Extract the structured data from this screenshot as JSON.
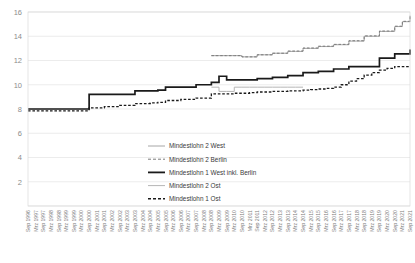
{
  "chart_data": {
    "type": "line",
    "title": "",
    "xlabel": "",
    "ylabel": "",
    "ylim": [
      0,
      16
    ],
    "ytick_step": 2,
    "yticks": [
      0,
      2,
      4,
      6,
      8,
      10,
      12,
      14,
      16
    ],
    "ytick_labels": [
      "0",
      "2",
      "4",
      "6",
      "8",
      "10",
      "12",
      "14",
      "16"
    ],
    "grid": true,
    "grid_axis": "y",
    "legend_position": "inside-bottom-center",
    "x": [
      "Sep 1996",
      "Mrz 1997",
      "Sep 1997",
      "Mrz 1998",
      "Sep 1998",
      "Mrz 1999",
      "Sep 1999",
      "Mrz 2000",
      "Sep 2000",
      "Mrz 2001",
      "Sep 2001",
      "Mrz 2002",
      "Sep 2002",
      "Mrz 2003",
      "Sep 2003",
      "Mrz 2004",
      "Sep 2004",
      "Mrz 2005",
      "Sep 2005",
      "Mrz 2006",
      "Sep 2006",
      "Mrz 2007",
      "Sep 2007",
      "Mrz 2008",
      "Sep 2008",
      "Mrz 2009",
      "Sep 2009",
      "Mrz 2010",
      "Sep 2010",
      "Mrz 2011",
      "Sep 2011",
      "Mrz 2012",
      "Sep 2012",
      "Mrz 2013",
      "Sep 2013",
      "Mrz 2014",
      "Sep 2014",
      "Mrz 2015",
      "Sep 2015",
      "Mrz 2016",
      "Sep 2016",
      "Mrz 2017",
      "Sep 2017",
      "Mrz 2018",
      "Sep 2018",
      "Mrz 2019",
      "Sep 2019",
      "Mrz 2020",
      "Sep 2020",
      "Mrz 2021",
      "Sep 2021"
    ],
    "series": [
      {
        "name": "Mindestlohn 2 West",
        "style": "solid",
        "color": "#a6a6a6",
        "width": 1.0,
        "start_index": 24,
        "values": [
          null,
          null,
          null,
          null,
          null,
          null,
          null,
          null,
          null,
          null,
          null,
          null,
          null,
          null,
          null,
          null,
          null,
          null,
          null,
          null,
          null,
          null,
          null,
          null,
          12.4,
          12.4,
          12.4,
          12.4,
          12.3,
          12.3,
          12.47,
          12.47,
          12.6,
          12.6,
          12.75,
          12.75,
          13.0,
          13.0,
          13.15,
          13.15,
          13.3,
          13.3,
          13.6,
          13.6,
          14.0,
          14.0,
          14.4,
          14.4,
          14.8,
          15.2,
          15.7
        ]
      },
      {
        "name": "Mindestlohn 2 Berlin",
        "style": "dashed",
        "color": "#7a7a7a",
        "width": 1.0,
        "start_index": 24,
        "values": [
          null,
          null,
          null,
          null,
          null,
          null,
          null,
          null,
          null,
          null,
          null,
          null,
          null,
          null,
          null,
          null,
          null,
          null,
          null,
          null,
          null,
          null,
          null,
          null,
          12.4,
          12.4,
          12.4,
          12.4,
          12.3,
          12.3,
          12.47,
          12.47,
          12.6,
          12.6,
          12.78,
          12.78,
          13.03,
          13.03,
          13.18,
          13.18,
          13.33,
          13.33,
          13.63,
          13.63,
          14.03,
          14.03,
          14.43,
          14.43,
          14.83,
          15.23,
          15.73
        ]
      },
      {
        "name": "Mindestlohn 1 West inkl. Berlin",
        "style": "solid",
        "color": "#1a1a1a",
        "width": 1.7,
        "start_index": 0,
        "values": [
          8.0,
          8.0,
          8.0,
          8.0,
          8.0,
          8.0,
          8.0,
          8.0,
          9.2,
          9.2,
          9.2,
          9.2,
          9.2,
          9.2,
          9.5,
          9.5,
          9.5,
          9.55,
          9.8,
          9.8,
          9.8,
          9.8,
          10.0,
          10.0,
          10.2,
          10.7,
          10.4,
          10.4,
          10.4,
          10.4,
          10.5,
          10.5,
          10.6,
          10.6,
          10.75,
          10.75,
          11.0,
          11.0,
          11.1,
          11.1,
          11.3,
          11.3,
          11.5,
          11.5,
          11.5,
          11.5,
          12.2,
          12.2,
          12.55,
          12.55,
          12.9
        ]
      },
      {
        "name": "Mindestlohn 2 Ost",
        "style": "solid",
        "color": "#b5b5b5",
        "width": 1.0,
        "start_index": 24,
        "values": [
          null,
          null,
          null,
          null,
          null,
          null,
          null,
          null,
          null,
          null,
          null,
          null,
          null,
          null,
          null,
          null,
          null,
          null,
          null,
          null,
          null,
          null,
          null,
          null,
          9.8,
          9.45,
          9.45,
          9.8,
          9.8,
          9.8,
          9.8,
          9.8,
          9.8,
          9.8,
          9.8,
          9.8,
          9.8,
          null,
          null,
          null,
          null,
          null,
          null,
          null,
          null,
          null,
          null,
          null,
          null,
          null,
          null
        ]
      },
      {
        "name": "Mindestlohn 1 Ost",
        "style": "dashed",
        "color": "#1a1a1a",
        "width": 1.3,
        "start_index": 0,
        "values": [
          7.85,
          7.85,
          7.85,
          7.85,
          7.85,
          7.85,
          7.85,
          7.85,
          8.1,
          8.1,
          8.2,
          8.2,
          8.3,
          8.3,
          8.45,
          8.45,
          8.5,
          8.55,
          8.7,
          8.7,
          8.8,
          8.8,
          8.9,
          8.9,
          9.25,
          9.25,
          9.25,
          9.3,
          9.3,
          9.35,
          9.4,
          9.4,
          9.45,
          9.45,
          9.5,
          9.5,
          9.55,
          9.6,
          9.65,
          9.7,
          9.8,
          10.0,
          10.3,
          10.5,
          10.8,
          11.0,
          11.2,
          11.35,
          11.5,
          11.5,
          11.5
        ]
      }
    ],
    "legend": [
      {
        "label": "Mindestlohn 2 West",
        "style": "solid",
        "color": "#a6a6a6",
        "width": 1.0
      },
      {
        "label": "Mindestlohn 2 Berlin",
        "style": "dashed",
        "color": "#7a7a7a",
        "width": 1.0
      },
      {
        "label": "Mindestlohn 1 West inkl. Berlin",
        "style": "solid",
        "color": "#1a1a1a",
        "width": 1.8
      },
      {
        "label": "Mindestlohn 2 Ost",
        "style": "solid",
        "color": "#b5b5b5",
        "width": 1.0
      },
      {
        "label": "Mindestlohn 1 Ost",
        "style": "dashed",
        "color": "#1a1a1a",
        "width": 1.4
      }
    ]
  }
}
